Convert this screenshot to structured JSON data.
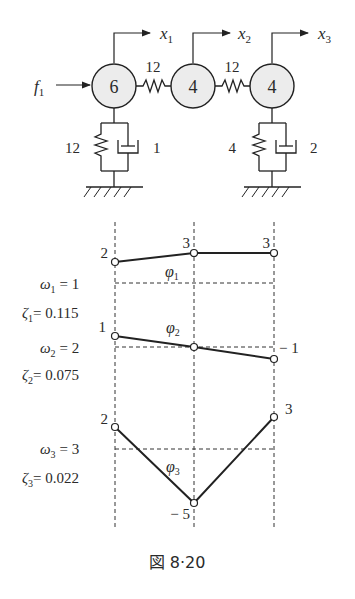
{
  "figure": {
    "caption": "図 8·20",
    "system": {
      "force_label": "f",
      "force_sub": "1",
      "masses": [
        {
          "value": "6",
          "disp": "x",
          "disp_sub": "1"
        },
        {
          "value": "4",
          "disp": "x",
          "disp_sub": "2"
        },
        {
          "value": "4",
          "disp": "x",
          "disp_sub": "3"
        }
      ],
      "coupling_springs": [
        "12",
        "12"
      ],
      "ground_left": {
        "spring": "12",
        "damper": "1"
      },
      "ground_right": {
        "spring": "4",
        "damper": "2"
      }
    },
    "modes": [
      {
        "phi": "φ",
        "phi_sub": "1",
        "omega": "ω",
        "omega_sub": "1",
        "omega_val": "= 1",
        "zeta": "ζ",
        "zeta_sub": "1",
        "zeta_val": "= 0.115",
        "values": [
          "2",
          "3",
          "3"
        ]
      },
      {
        "phi": "φ",
        "phi_sub": "2",
        "omega": "ω",
        "omega_sub": "2",
        "omega_val": "= 2",
        "zeta": "ζ",
        "zeta_sub": "2",
        "zeta_val": "= 0.075",
        "values": [
          "1",
          "",
          "− 1"
        ]
      },
      {
        "phi": "φ",
        "phi_sub": "3",
        "omega": "ω",
        "omega_sub": "3",
        "omega_val": "= 3",
        "zeta": "ζ",
        "zeta_sub": "3",
        "zeta_val": "= 0.022",
        "values": [
          "2",
          "− 5",
          "3"
        ]
      }
    ]
  }
}
